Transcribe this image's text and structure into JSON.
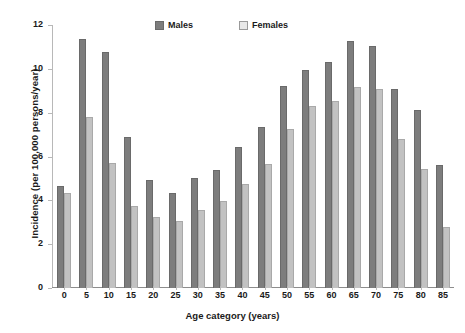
{
  "chart_data": {
    "type": "bar",
    "title": "",
    "xlabel": "Age category (years)",
    "ylabel": "Incidence  (per 100,000 persons/year)",
    "categories": [
      "0",
      "5",
      "10",
      "15",
      "20",
      "25",
      "30",
      "35",
      "40",
      "45",
      "50",
      "55",
      "60",
      "65",
      "70",
      "75",
      "80",
      "85"
    ],
    "yticks": [
      "0",
      "2",
      "4",
      "6",
      "8",
      "10",
      "12"
    ],
    "ylim": [
      0,
      12
    ],
    "grid": false,
    "legend_position": "top-center",
    "series": [
      {
        "name": "Males",
        "color": "#7d7d7d",
        "values": [
          4.65,
          11.35,
          10.75,
          6.9,
          4.95,
          4.35,
          5.0,
          5.4,
          6.45,
          7.35,
          9.2,
          9.95,
          10.3,
          11.25,
          11.05,
          9.1,
          8.1,
          5.6
        ]
      },
      {
        "name": "Females",
        "color": "#c2c2c2",
        "values": [
          4.35,
          7.8,
          5.7,
          3.75,
          3.25,
          3.05,
          3.55,
          3.95,
          4.75,
          5.65,
          7.25,
          8.3,
          8.55,
          9.15,
          9.1,
          6.8,
          5.45,
          2.8
        ]
      }
    ]
  },
  "legend": {
    "items": [
      {
        "label": "Males",
        "swatch": "males-swatch"
      },
      {
        "label": "Females",
        "swatch": "females-swatch"
      }
    ]
  },
  "caption_strip": ""
}
